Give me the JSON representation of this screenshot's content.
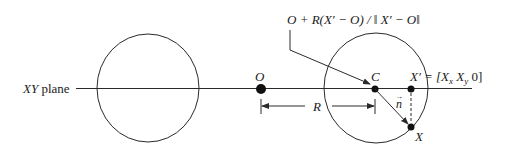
{
  "diagram": {
    "plane_label_italic": "XY",
    "plane_label_rest": " plane",
    "formula": "O + R(X′ − O) / ‖ X′ − O‖",
    "points": {
      "origin": "O",
      "center": "C",
      "projection": "X′ = [X",
      "projection_sub_x": "x",
      "projection_mid": " X",
      "projection_sub_y": "y",
      "projection_end": " 0]",
      "point": "X"
    },
    "radius_label": "R",
    "normal_label": "n",
    "normal_arrow_glyph": "→",
    "colors": {
      "stroke": "#2a2a2a",
      "background": "#ffffff"
    }
  }
}
